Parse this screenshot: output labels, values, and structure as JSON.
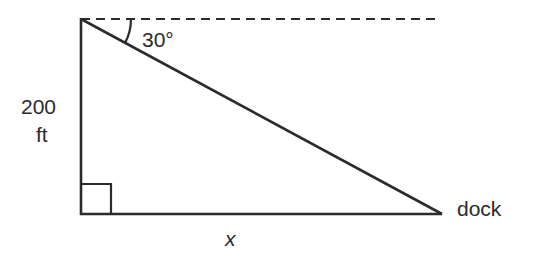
{
  "diagram": {
    "type": "right-triangle",
    "colors": {
      "line": "#2b2b2b",
      "text": "#2b2b2b",
      "background": "#ffffff"
    },
    "labels": {
      "angle": "30°",
      "height_value": "200",
      "height_unit": "ft",
      "base": "x",
      "right_vertex": "dock"
    },
    "geometry": {
      "top_vertex": [
        81,
        19
      ],
      "right_angle_vertex": [
        81,
        214
      ],
      "dock_vertex": [
        442,
        214
      ],
      "horizontal_dashed_line_end": [
        435,
        19
      ],
      "angle_of_depression_deg": 30
    }
  }
}
